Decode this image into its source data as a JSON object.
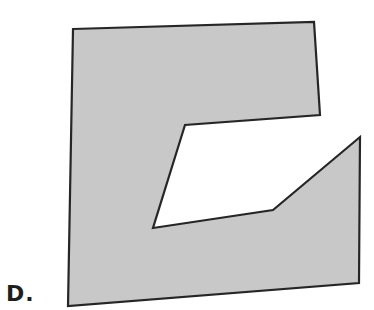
{
  "figure": {
    "label": "D.",
    "shape": {
      "type": "polygon",
      "fill": "#c8c8c8",
      "stroke": "#262626",
      "stroke_width": 2.2,
      "points": "73,29 314,22 320,115 185,125 153,228 273,210 360,137 359,283 68,306"
    }
  }
}
